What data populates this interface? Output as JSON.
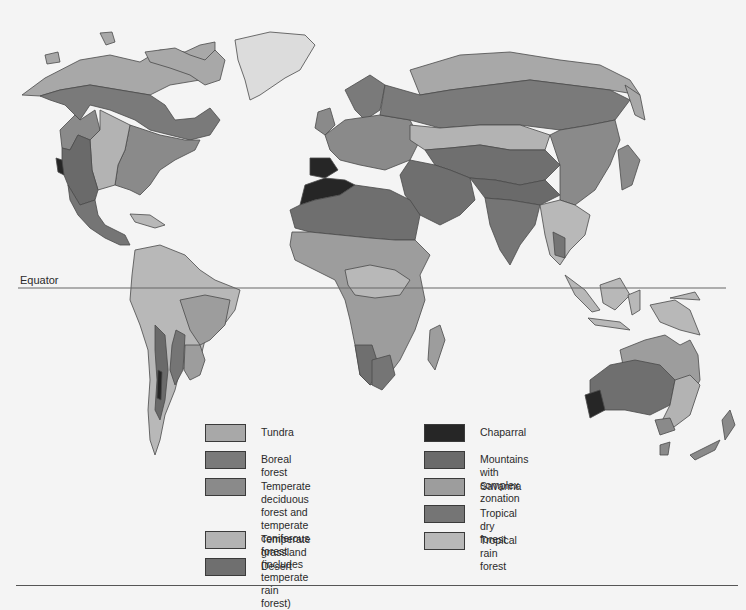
{
  "map": {
    "equator_label": "Equator",
    "colors": {
      "background": "#f4f4f4",
      "outline": "#4a4a4a",
      "tundra": "#a8a8a8",
      "boreal_forest": "#7a7a7a",
      "temperate_forest": "#8a8a8a",
      "temperate_grassland": "#b3b3b3",
      "desert": "#6f6f6f",
      "chaparral": "#262626",
      "mountains": "#6a6a6a",
      "savanna": "#9d9d9d",
      "tropical_dry_forest": "#757575",
      "tropical_rain_forest": "#b8b8b8",
      "ice": "#dcdcdc"
    }
  },
  "legend": {
    "left": [
      {
        "label": "Tundra",
        "color": "#a8a8a8"
      },
      {
        "label": "Boreal forest",
        "color": "#7a7a7a"
      },
      {
        "label": "Temperate deciduous forest and\ntemperate coniferous forest\n(includes temperate rain forest)",
        "color": "#8a8a8a"
      },
      {
        "label": "Temperate grassland",
        "color": "#b3b3b3"
      },
      {
        "label": "Desert",
        "color": "#6f6f6f"
      }
    ],
    "right": [
      {
        "label": "Chaparral",
        "color": "#262626"
      },
      {
        "label": "Mountains with complex zonation",
        "color": "#6a6a6a"
      },
      {
        "label": "Savanna",
        "color": "#9d9d9d"
      },
      {
        "label": "Tropical dry forest",
        "color": "#757575"
      },
      {
        "label": "Tropical rain forest",
        "color": "#b8b8b8"
      }
    ]
  }
}
